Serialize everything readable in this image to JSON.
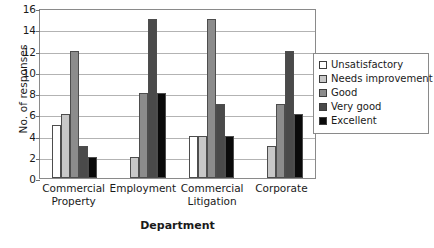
{
  "chart_data": {
    "type": "bar",
    "title": "",
    "xlabel": "Department",
    "ylabel": "No. of responses",
    "ylim": [
      0,
      16
    ],
    "ytick_step": 2,
    "yticks": [
      0,
      2,
      4,
      6,
      8,
      10,
      12,
      14,
      16
    ],
    "grid": true,
    "legend_position": "right",
    "categories": [
      "Commercial Property",
      "Employment",
      "Commercial Litigation",
      "Corporate"
    ],
    "category_lines": [
      [
        "Commercial",
        "Property"
      ],
      [
        "Employment",
        ""
      ],
      [
        "Commercial",
        "Litigation"
      ],
      [
        "Corporate",
        ""
      ]
    ],
    "series": [
      {
        "name": "Unsatisfactory",
        "color": "#ffffff",
        "values": [
          5,
          0,
          4,
          0
        ]
      },
      {
        "name": "Needs improvement",
        "color": "#c8c8c8",
        "values": [
          6,
          2,
          4,
          3
        ]
      },
      {
        "name": "Good",
        "color": "#8c8c8c",
        "values": [
          12,
          8,
          15,
          7
        ]
      },
      {
        "name": "Very good",
        "color": "#4a4a4a",
        "values": [
          3,
          15,
          7,
          12
        ]
      },
      {
        "name": "Excellent",
        "color": "#0a0a0a",
        "values": [
          2,
          8,
          4,
          6
        ]
      }
    ]
  },
  "colors": {
    "plot_border": "#8a8a8a",
    "gridline": "#b3b3b3",
    "bar_outline": "#4d4d4d",
    "background": "#ffffff",
    "text": "#1a1a1a"
  }
}
